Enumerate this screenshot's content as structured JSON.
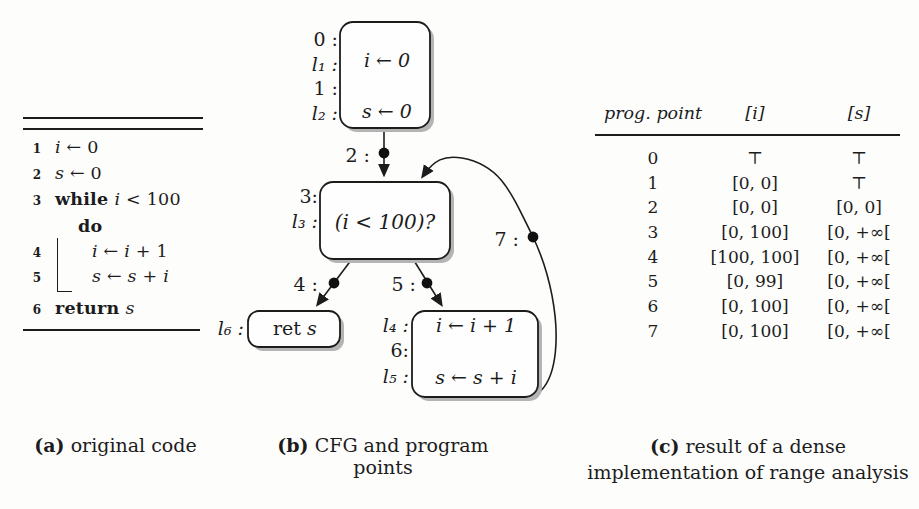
{
  "figure": {
    "colors": {
      "ink": "#1c1c1c",
      "paper": "#fdfdfc",
      "node_fill": "#fefefe",
      "shadow": "#b4b4b4"
    },
    "panel_a": {
      "caption_label": "(a)",
      "caption_text": "original code",
      "lines": [
        {
          "num": "1",
          "body": [
            {
              "t": "i",
              "s": "i"
            },
            {
              "t": " ← 0",
              "s": "r"
            }
          ]
        },
        {
          "num": "2",
          "body": [
            {
              "t": "s",
              "s": "i"
            },
            {
              "t": " ← 0",
              "s": "r"
            }
          ]
        },
        {
          "num": "3",
          "body": [
            {
              "t": "while ",
              "s": "b"
            },
            {
              "t": "i",
              "s": "i"
            },
            {
              "t": " < 100",
              "s": "r"
            }
          ]
        },
        {
          "num": "",
          "body": [
            {
              "t": "do",
              "s": "b"
            }
          ]
        },
        {
          "num": "4",
          "body": [
            {
              "t": "i",
              "s": "i"
            },
            {
              "t": " ← ",
              "s": "r"
            },
            {
              "t": "i",
              "s": "i"
            },
            {
              "t": " + 1",
              "s": "r"
            }
          ]
        },
        {
          "num": "5",
          "body": [
            {
              "t": "s",
              "s": "i"
            },
            {
              "t": " ← ",
              "s": "r"
            },
            {
              "t": "s",
              "s": "i"
            },
            {
              "t": " + ",
              "s": "r"
            },
            {
              "t": "i",
              "s": "i"
            }
          ]
        },
        {
          "num": "6",
          "body": [
            {
              "t": "return ",
              "s": "b"
            },
            {
              "t": "s",
              "s": "i"
            }
          ]
        }
      ]
    },
    "panel_b": {
      "caption_label": "(b)",
      "caption_text": "CFG and program points",
      "cfg": {
        "b1_labels": {
          "p0": "0 :",
          "l1": "l₁ :",
          "p1": "1 :",
          "l2": "l₂ :"
        },
        "b1_stmt1": "i ← 0",
        "b1_stmt2": "s ← 0",
        "p2": "2 :",
        "b2_labels": {
          "p3": "3:",
          "l3": "l₃ :"
        },
        "b2_cond": "(i < 100)?",
        "p4": "4 :",
        "p5": "5 :",
        "p7": "7 :",
        "b3_label": "l₆ :",
        "b3_kw": "ret",
        "b3_var": "s",
        "b4_labels": {
          "l4": "l₄ :",
          "p6": "6:",
          "l5": "l₅ :"
        },
        "b4_stmt1": "i ← i + 1",
        "b4_stmt2": "s ← s + i"
      }
    },
    "panel_c": {
      "caption_label": "(c)",
      "caption_line1": "result of  a dense",
      "caption_line2": "implementation of range analysis",
      "table": {
        "headers": [
          "prog. point",
          "[i]",
          "[s]"
        ],
        "rows": [
          [
            "0",
            "⊤",
            "⊤"
          ],
          [
            "1",
            "[0, 0]",
            "⊤"
          ],
          [
            "2",
            "[0, 0]",
            "[0, 0]"
          ],
          [
            "3",
            "[0, 100]",
            "[0, +∞["
          ],
          [
            "4",
            "[100, 100]",
            "[0, +∞["
          ],
          [
            "5",
            "[0, 99]",
            "[0, +∞["
          ],
          [
            "6",
            "[0, 100]",
            "[0, +∞["
          ],
          [
            "7",
            "[0, 100]",
            "[0, +∞["
          ]
        ]
      }
    }
  }
}
